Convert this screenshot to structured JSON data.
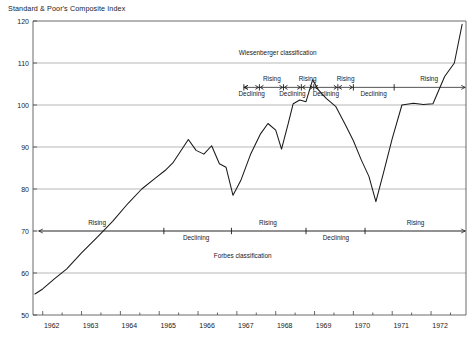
{
  "chart_data": {
    "type": "line",
    "title": "Standard & Poor's Composite Index",
    "xlabel": "",
    "ylabel": "",
    "grid": true,
    "legend": "none",
    "xlim": [
      1961.75,
      1972.9
    ],
    "ylim": [
      50,
      120
    ],
    "yticks": [
      50,
      60,
      70,
      80,
      90,
      100,
      110,
      120
    ],
    "xticks": [
      1962,
      1963,
      1964,
      1965,
      1966,
      1967,
      1968,
      1969,
      1970,
      1971,
      1972
    ],
    "xticklabels": [
      "1962",
      "1963",
      "1964",
      "1965",
      "1966",
      "1967",
      "1968",
      "1969",
      "1970",
      "1971",
      "1972"
    ],
    "yticklabels": [
      "50",
      "60",
      "70",
      "80",
      "90",
      "100",
      "110",
      "120"
    ],
    "series": [
      {
        "name": "S&P Composite Index",
        "x": [
          1961.8,
          1962.0,
          1962.3,
          1962.62,
          1963.0,
          1963.4,
          1963.8,
          1964.2,
          1964.55,
          1964.9,
          1965.15,
          1965.35,
          1965.55,
          1965.75,
          1965.95,
          1966.15,
          1966.35,
          1966.55,
          1966.72,
          1966.9,
          1967.1,
          1967.35,
          1967.6,
          1967.8,
          1968.0,
          1968.15,
          1968.32,
          1968.45,
          1968.62,
          1968.78,
          1968.95,
          1969.1,
          1969.3,
          1969.55,
          1969.8,
          1970.0,
          1970.2,
          1970.4,
          1970.58,
          1970.78,
          1971.0,
          1971.25,
          1971.55,
          1971.8,
          1972.05,
          1972.35,
          1972.6,
          1972.8
        ],
        "y": [
          55.0,
          56.2,
          58.6,
          61.0,
          64.8,
          68.5,
          72.3,
          76.6,
          80.0,
          82.6,
          84.4,
          86.2,
          89.0,
          91.8,
          89.2,
          88.3,
          90.3,
          86.0,
          85.2,
          78.5,
          82.0,
          88.2,
          93.0,
          95.6,
          94.0,
          89.5,
          95.5,
          100.3,
          101.2,
          100.8,
          106.0,
          103.6,
          101.6,
          99.6,
          95.2,
          91.5,
          87.0,
          83.0,
          77.0,
          84.0,
          92.0,
          100.0,
          100.4,
          100.1,
          100.3,
          106.8,
          110.0,
          119.2
        ]
      }
    ],
    "annotation_bands": [
      {
        "id": "wiesenberger",
        "label": "Wiesenberger classification",
        "label_x": 1968.05,
        "level": 104.2,
        "label_y": 112.0,
        "x_start": 1967.18,
        "x_end": 1972.88,
        "segments": [
          {
            "label": "Declining",
            "position": "below",
            "x_start": 1967.18,
            "x_end": 1967.58,
            "label_x": 1967.38
          },
          {
            "label": "Rising",
            "position": "above",
            "x_start": 1967.58,
            "x_end": 1968.2,
            "label_x": 1967.9
          },
          {
            "label": "Declining",
            "position": "below",
            "x_start": 1968.2,
            "x_end": 1968.66,
            "label_x": 1968.43
          },
          {
            "label": "Rising",
            "position": "above",
            "x_start": 1968.66,
            "x_end": 1968.98,
            "label_x": 1968.82
          },
          {
            "label": "Declining",
            "position": "below",
            "x_start": 1968.98,
            "x_end": 1969.6,
            "label_x": 1969.29
          },
          {
            "label": "Rising",
            "position": "above",
            "x_start": 1969.6,
            "x_end": 1970.0,
            "label_x": 1969.8
          },
          {
            "label": "Declining",
            "position": "below",
            "x_start": 1970.0,
            "x_end": 1971.05,
            "label_x": 1970.52
          },
          {
            "label": "Rising",
            "position": "above",
            "x_start": 1971.05,
            "x_end": 1972.88,
            "label_x": 1971.95
          }
        ],
        "ticks": [
          1967.18,
          1967.58,
          1968.2,
          1968.66,
          1968.98,
          1969.6,
          1970.0,
          1971.05
        ]
      },
      {
        "id": "forbes",
        "label": "Forbes classification",
        "label_x": 1967.15,
        "level": 70.0,
        "label_y": 63.5,
        "x_start": 1961.9,
        "x_end": 1972.88,
        "segments": [
          {
            "label": "Rising",
            "position": "above",
            "x_start": 1961.9,
            "x_end": 1965.12,
            "label_x": 1963.4
          },
          {
            "label": "Declining",
            "position": "below",
            "x_start": 1965.12,
            "x_end": 1966.86,
            "label_x": 1965.95
          },
          {
            "label": "Rising",
            "position": "above",
            "x_start": 1966.86,
            "x_end": 1968.78,
            "label_x": 1967.8
          },
          {
            "label": "Declining",
            "position": "below",
            "x_start": 1968.78,
            "x_end": 1970.3,
            "label_x": 1969.55
          },
          {
            "label": "Rising",
            "position": "above",
            "x_start": 1970.3,
            "x_end": 1972.88,
            "label_x": 1971.6
          }
        ],
        "ticks": [
          1965.12,
          1966.86,
          1968.78,
          1970.3
        ]
      }
    ]
  }
}
